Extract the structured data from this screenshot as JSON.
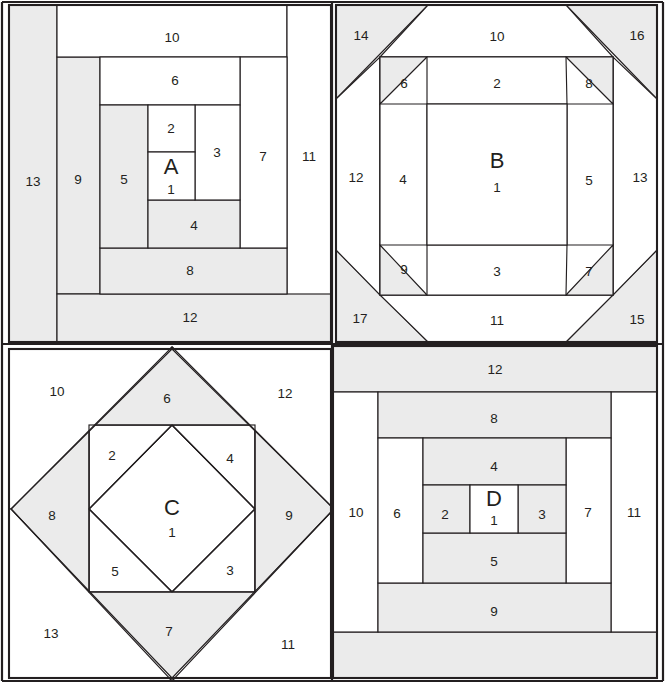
{
  "diagram": {
    "type": "quilt-block-piecing-diagram",
    "canvas": {
      "width": 665,
      "height": 683
    },
    "colors": {
      "light": "#ffffff",
      "shaded": "#ebebeb",
      "line": "#231f20",
      "background": "#ffffff"
    },
    "grid": {
      "rows": 2,
      "cols": 2
    }
  },
  "blocks": [
    {
      "id": "A",
      "name": "block-a",
      "position": "top-left",
      "center_letter": "A",
      "style": "courthouse-steps-log-cabin",
      "piece_count": 13,
      "pieces": [
        {
          "n": "1",
          "label": "1",
          "shade": "light",
          "cx": 171,
          "cy": 182
        },
        {
          "n": "2",
          "label": "2",
          "shade": "light",
          "cx": 171,
          "cy": 128
        },
        {
          "n": "3",
          "label": "3",
          "shade": "light",
          "cx": 217,
          "cy": 153
        },
        {
          "n": "4",
          "label": "4",
          "shade": "shaded",
          "cx": 194,
          "cy": 226
        },
        {
          "n": "5",
          "label": "5",
          "shade": "shaded",
          "cx": 125,
          "cy": 180
        },
        {
          "n": "6",
          "label": "6",
          "shade": "light",
          "cx": 175,
          "cy": 81
        },
        {
          "n": "7",
          "label": "7",
          "shade": "light",
          "cx": 263,
          "cy": 157
        },
        {
          "n": "8",
          "label": "8",
          "shade": "shaded",
          "cx": 190,
          "cy": 271
        },
        {
          "n": "9",
          "label": "9",
          "shade": "shaded",
          "cx": 78,
          "cy": 180
        },
        {
          "n": "10",
          "label": "10",
          "shade": "light",
          "cx": 172,
          "cy": 38
        },
        {
          "n": "11",
          "label": "11",
          "shade": "light",
          "cx": 309,
          "cy": 157
        },
        {
          "n": "12",
          "label": "12",
          "shade": "shaded",
          "cx": 190,
          "cy": 318
        },
        {
          "n": "13",
          "label": "13",
          "shade": "shaded",
          "cx": 33,
          "cy": 182
        }
      ]
    },
    {
      "id": "B",
      "name": "block-b",
      "position": "top-right",
      "center_letter": "B",
      "style": "pineapple-log-cabin",
      "piece_count": 17,
      "pieces": [
        {
          "n": "1",
          "label": "1",
          "shade": "light",
          "cx": 497,
          "cy": 188
        },
        {
          "n": "2",
          "label": "2",
          "shade": "light",
          "cx": 497,
          "cy": 84
        },
        {
          "n": "3",
          "label": "3",
          "shade": "light",
          "cx": 497,
          "cy": 272
        },
        {
          "n": "4",
          "label": "4",
          "shade": "light",
          "cx": 403,
          "cy": 180
        },
        {
          "n": "5",
          "label": "5",
          "shade": "light",
          "cx": 589,
          "cy": 181
        },
        {
          "n": "6",
          "label": "6",
          "shade": "shaded",
          "cx": 404,
          "cy": 84
        },
        {
          "n": "7",
          "label": "7",
          "shade": "shaded",
          "cx": 589,
          "cy": 272
        },
        {
          "n": "8",
          "label": "8",
          "shade": "shaded",
          "cx": 589,
          "cy": 84
        },
        {
          "n": "9",
          "label": "9",
          "shade": "shaded",
          "cx": 404,
          "cy": 270
        },
        {
          "n": "10",
          "label": "10",
          "shade": "light",
          "cx": 497,
          "cy": 37
        },
        {
          "n": "11",
          "label": "11",
          "shade": "light",
          "cx": 497,
          "cy": 321
        },
        {
          "n": "12",
          "label": "12",
          "shade": "light",
          "cx": 356,
          "cy": 178
        },
        {
          "n": "13",
          "label": "13",
          "shade": "light",
          "cx": 640,
          "cy": 178
        },
        {
          "n": "14",
          "label": "14",
          "shade": "shaded",
          "cx": 361,
          "cy": 36
        },
        {
          "n": "15",
          "label": "15",
          "shade": "shaded",
          "cx": 637,
          "cy": 320
        },
        {
          "n": "16",
          "label": "16",
          "shade": "shaded",
          "cx": 637,
          "cy": 36
        },
        {
          "n": "17",
          "label": "17",
          "shade": "shaded",
          "cx": 360,
          "cy": 319
        }
      ]
    },
    {
      "id": "C",
      "name": "block-c",
      "position": "bottom-left",
      "center_letter": "C",
      "style": "economy-square-in-a-square",
      "piece_count": 13,
      "pieces": [
        {
          "n": "1",
          "label": "1",
          "shade": "light",
          "cx": 172,
          "cy": 521
        },
        {
          "n": "2",
          "label": "2",
          "shade": "light",
          "cx": 112,
          "cy": 456
        },
        {
          "n": "3",
          "label": "3",
          "shade": "light",
          "cx": 230,
          "cy": 571
        },
        {
          "n": "4",
          "label": "4",
          "shade": "light",
          "cx": 230,
          "cy": 459
        },
        {
          "n": "5",
          "label": "5",
          "shade": "light",
          "cx": 115,
          "cy": 572
        },
        {
          "n": "6",
          "label": "6",
          "shade": "shaded",
          "cx": 167,
          "cy": 399
        },
        {
          "n": "7",
          "label": "7",
          "shade": "shaded",
          "cx": 169,
          "cy": 632
        },
        {
          "n": "8",
          "label": "8",
          "shade": "shaded",
          "cx": 52,
          "cy": 516
        },
        {
          "n": "9",
          "label": "9",
          "shade": "shaded",
          "cx": 289,
          "cy": 516
        },
        {
          "n": "10",
          "label": "10",
          "shade": "light",
          "cx": 57,
          "cy": 392
        },
        {
          "n": "11",
          "label": "11",
          "shade": "light",
          "cx": 288,
          "cy": 645
        },
        {
          "n": "12",
          "label": "12",
          "shade": "light",
          "cx": 285,
          "cy": 394
        },
        {
          "n": "13",
          "label": "13",
          "shade": "light",
          "cx": 51,
          "cy": 634
        }
      ]
    },
    {
      "id": "D",
      "name": "block-d",
      "position": "bottom-right",
      "center_letter": "D",
      "style": "courthouse-steps",
      "piece_count": 13,
      "pieces": [
        {
          "n": "1",
          "label": "1",
          "shade": "light",
          "cx": 494,
          "cy": 519
        },
        {
          "n": "2",
          "label": "2",
          "shade": "shaded",
          "cx": 445,
          "cy": 515
        },
        {
          "n": "3",
          "label": "3",
          "shade": "shaded",
          "cx": 542,
          "cy": 515
        },
        {
          "n": "4",
          "label": "4",
          "shade": "shaded",
          "cx": 494,
          "cy": 467
        },
        {
          "n": "5",
          "label": "5",
          "shade": "shaded",
          "cx": 494,
          "cy": 562
        },
        {
          "n": "6",
          "label": "6",
          "shade": "light",
          "cx": 397,
          "cy": 514
        },
        {
          "n": "7",
          "label": "7",
          "shade": "light",
          "cx": 588,
          "cy": 513
        },
        {
          "n": "8",
          "label": "8",
          "shade": "shaded",
          "cx": 494,
          "cy": 419
        },
        {
          "n": "9",
          "label": "9",
          "shade": "shaded",
          "cx": 494,
          "cy": 612
        },
        {
          "n": "10",
          "label": "10",
          "shade": "light",
          "cx": 356,
          "cy": 513
        },
        {
          "n": "11",
          "label": "11",
          "shade": "light",
          "cx": 634,
          "cy": 513
        },
        {
          "n": "12",
          "label": "12",
          "shade": "shaded",
          "cx": 495,
          "cy": 370
        },
        {
          "n": "13",
          "label": "13",
          "shade": "shaded",
          "cx": 497,
          "cy": 657
        }
      ]
    }
  ]
}
